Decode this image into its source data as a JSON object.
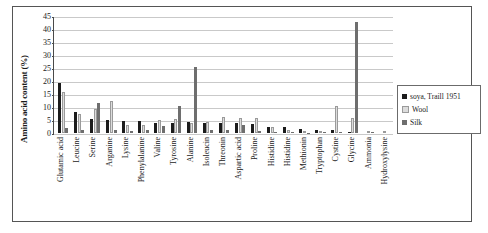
{
  "chart_data": {
    "type": "bar",
    "title": "",
    "xlabel": "",
    "ylabel": "Amino acid content (%)",
    "ylim": [
      0,
      45
    ],
    "yticks": [
      0,
      5,
      10,
      15,
      20,
      25,
      30,
      35,
      40,
      45
    ],
    "grid": true,
    "legend_position": "right",
    "categories": [
      "Glutamic acid",
      "Leucine",
      "Serine",
      "Arganine",
      "Lysine",
      "Phenylalanine",
      "Valine",
      "Tyrosine",
      "Alanine",
      "Isoleucin",
      "Threonin",
      "Aspartic acid",
      "Proline",
      "Histidine",
      "Histidine",
      "Methionin",
      "Tryptophan",
      "Cystine",
      "Glycine",
      "Ammonia",
      "Hydroxylysine"
    ],
    "series": [
      {
        "name": "soya, Traill 1951",
        "color": "#1c1c1c",
        "values": [
          19.5,
          8.0,
          5.5,
          5.2,
          4.5,
          4.5,
          4.0,
          3.8,
          4.2,
          4.0,
          3.8,
          4.0,
          3.5,
          2.4,
          2.2,
          1.4,
          1.2,
          1.0,
          0.4,
          0.0,
          0.0
        ]
      },
      {
        "name": "Wool",
        "color": "#dcdcdc",
        "values": [
          16.0,
          7.5,
          9.5,
          12.3,
          3.2,
          3.0,
          5.0,
          5.3,
          4.0,
          4.4,
          6.2,
          5.8,
          6.0,
          2.4,
          1.0,
          0.6,
          0.7,
          10.5,
          5.9,
          0.0,
          0.0
        ]
      },
      {
        "name": "Silk",
        "color": "#6e6e6e",
        "values": [
          2.0,
          1.0,
          11.5,
          1.0,
          0.6,
          1.3,
          2.8,
          10.5,
          25.5,
          1.0,
          1.0,
          3.0,
          0.8,
          0.5,
          0.4,
          0.2,
          0.3,
          0.3,
          43.0,
          0.3,
          0.0
        ]
      }
    ]
  },
  "legend": {
    "items": [
      {
        "label": "soya, Traill 1951"
      },
      {
        "label": "Wool"
      },
      {
        "label": "Silk"
      }
    ]
  }
}
